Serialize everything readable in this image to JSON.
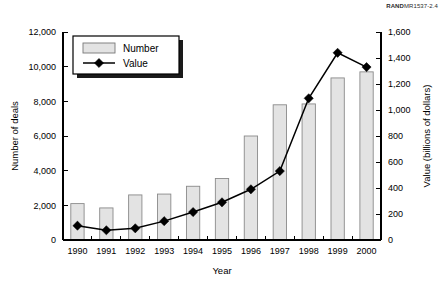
{
  "source_slug": {
    "brand": "RAND",
    "report": "MR1537-2.4"
  },
  "legend": {
    "position": "top-left-inside",
    "entries": [
      {
        "label": "Number",
        "marker": "filled-rect-swatch"
      },
      {
        "label": "Value",
        "marker": "line-with-diamond"
      }
    ]
  },
  "colors": {
    "bar_fill": "#e3e3e3",
    "bar_stroke": "#8a8a8a",
    "line": "#000000",
    "marker": "#000000",
    "axis": "#000000",
    "background": "#ffffff"
  },
  "chart_data": {
    "type": "bar",
    "title": "",
    "subtitle": "",
    "xlabel": "Year",
    "ylabel": "Number of deals",
    "y2label": "Value (billions of dollars)",
    "categories": [
      "1990",
      "1991",
      "1992",
      "1993",
      "1994",
      "1995",
      "1996",
      "1997",
      "1998",
      "1999",
      "2000"
    ],
    "ylim": [
      0,
      12000
    ],
    "y2lim": [
      0,
      1600
    ],
    "yticks": [
      0,
      2000,
      4000,
      6000,
      8000,
      10000,
      12000
    ],
    "ytick_labels": [
      "0",
      "2,000",
      "4,000",
      "6,000",
      "8,000",
      "10,000",
      "12,000"
    ],
    "y2ticks": [
      0,
      200,
      400,
      600,
      800,
      1000,
      1200,
      1400,
      1600
    ],
    "y2tick_labels": [
      "0",
      "200",
      "400",
      "600",
      "800",
      "1,000",
      "1,200",
      "1,400",
      "1,600"
    ],
    "grid": false,
    "legend": true,
    "series": [
      {
        "name": "Number",
        "kind": "bar",
        "axis": "left",
        "unit": "deals",
        "values": [
          2100,
          1850,
          2600,
          2650,
          3100,
          3550,
          6000,
          7800,
          7850,
          9350,
          9700
        ]
      },
      {
        "name": "Value",
        "kind": "line",
        "axis": "right",
        "unit": "billions of dollars",
        "values": [
          110,
          75,
          90,
          145,
          215,
          290,
          390,
          530,
          1090,
          1440,
          1330
        ]
      }
    ]
  }
}
